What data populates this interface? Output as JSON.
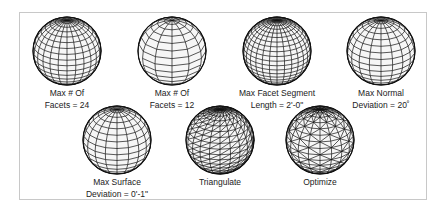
{
  "figure": {
    "items": [
      {
        "line1": "Max # Of",
        "line2": "Facets = 24",
        "style": "grid-fine"
      },
      {
        "line1": "Max # Of",
        "line2": "Facets = 12",
        "style": "grid-coarse"
      },
      {
        "line1": "Max Facet Segment",
        "line2": "Length = 2'-0\"",
        "style": "grid-dense"
      },
      {
        "line1": "Max Normal",
        "line2": "Deviation = 20˚",
        "style": "grid-medium"
      },
      {
        "line1": "Max Surface",
        "line2": "Deviation = 0'-1\"",
        "style": "grid-medium"
      },
      {
        "line1": "Triangulate",
        "line2": "",
        "style": "triangulated"
      },
      {
        "line1": "Optimize",
        "line2": "",
        "style": "triangulated-optimized"
      }
    ]
  }
}
